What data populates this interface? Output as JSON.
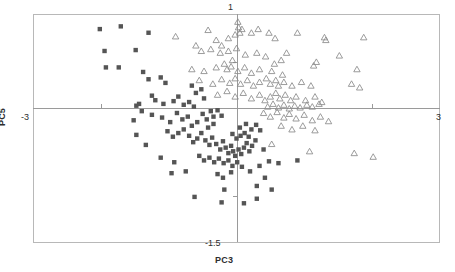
{
  "chart_data": {
    "type": "scatter",
    "title": "",
    "subtitle": "",
    "xlabel": "PC3",
    "ylabel": "PC5",
    "xlim": [
      -3,
      3
    ],
    "ylim": [
      -1.5,
      1
    ],
    "xticks": [
      -3,
      3
    ],
    "xtick_labels": [
      "-3",
      "3"
    ],
    "yticks": [
      -1.5,
      1
    ],
    "ytick_labels": [
      "-1.5",
      "1"
    ],
    "grid": false,
    "legend": "none",
    "axes_style": "crossed-at-origin-with-frame",
    "series": [
      {
        "name": "group-squares",
        "marker": "filled-square",
        "color": "#555555",
        "points": [
          [
            -2.02,
            0.84
          ],
          [
            -1.71,
            0.87
          ],
          [
            -1.3,
            0.8
          ],
          [
            -1.95,
            0.6
          ],
          [
            -1.49,
            0.61
          ],
          [
            -1.93,
            0.42
          ],
          [
            -1.74,
            0.42
          ],
          [
            -1.38,
            0.37
          ],
          [
            -1.3,
            0.29
          ],
          [
            -1.12,
            0.31
          ],
          [
            -1.05,
            0.25
          ],
          [
            -1.25,
            0.11
          ],
          [
            -1.2,
            0.06
          ],
          [
            -1.08,
            0.02
          ],
          [
            -0.93,
            0.05
          ],
          [
            -0.86,
            0.1
          ],
          [
            -0.78,
            0.01
          ],
          [
            -0.7,
            0.04
          ],
          [
            -0.63,
            -0.01
          ],
          [
            -1.44,
            0.02
          ],
          [
            -1.48,
            0.0
          ],
          [
            -1.4,
            -0.06
          ],
          [
            -1.52,
            -0.16
          ],
          [
            -1.25,
            -0.1
          ],
          [
            -1.1,
            -0.13
          ],
          [
            -0.98,
            -0.18
          ],
          [
            -0.88,
            -0.08
          ],
          [
            -0.8,
            -0.15
          ],
          [
            -0.72,
            -0.12
          ],
          [
            -0.66,
            -0.22
          ],
          [
            -0.58,
            -0.18
          ],
          [
            -0.5,
            -0.09
          ],
          [
            -0.44,
            -0.15
          ],
          [
            -0.38,
            -0.06
          ],
          [
            -0.34,
            -0.12
          ],
          [
            -0.28,
            -0.05
          ],
          [
            -0.22,
            -0.11
          ],
          [
            -1.02,
            -0.28
          ],
          [
            -0.94,
            -0.34
          ],
          [
            -0.86,
            -0.3
          ],
          [
            -0.78,
            -0.26
          ],
          [
            -0.7,
            -0.33
          ],
          [
            -0.64,
            -0.4
          ],
          [
            -0.58,
            -0.36
          ],
          [
            -0.52,
            -0.3
          ],
          [
            -0.46,
            -0.38
          ],
          [
            -0.4,
            -0.43
          ],
          [
            -0.36,
            -0.35
          ],
          [
            -0.3,
            -0.42
          ],
          [
            -0.24,
            -0.48
          ],
          [
            -0.2,
            -0.39
          ],
          [
            -0.16,
            -0.46
          ],
          [
            -0.12,
            -0.52
          ],
          [
            -0.08,
            -0.44
          ],
          [
            -0.05,
            -0.5
          ],
          [
            -0.02,
            -0.55
          ],
          [
            0.03,
            -0.48
          ],
          [
            0.07,
            -0.53
          ],
          [
            0.11,
            -0.46
          ],
          [
            0.15,
            -0.41
          ],
          [
            0.19,
            -0.5
          ],
          [
            0.23,
            -0.44
          ],
          [
            0.28,
            -0.38
          ],
          [
            0.18,
            -0.34
          ],
          [
            0.12,
            -0.3
          ],
          [
            0.06,
            -0.33
          ],
          [
            0.0,
            -0.36
          ],
          [
            -0.06,
            -0.31
          ],
          [
            -0.55,
            -0.55
          ],
          [
            -0.48,
            -0.6
          ],
          [
            -0.4,
            -0.57
          ],
          [
            -0.33,
            -0.62
          ],
          [
            -0.26,
            -0.58
          ],
          [
            -0.19,
            -0.63
          ],
          [
            -0.12,
            -0.6
          ],
          [
            -0.06,
            -0.66
          ],
          [
            0.01,
            -0.62
          ],
          [
            0.08,
            -0.67
          ],
          [
            -0.92,
            -0.62
          ],
          [
            -1.12,
            -0.57
          ],
          [
            -0.28,
            -0.75
          ],
          [
            -0.2,
            -0.79
          ],
          [
            -0.08,
            -0.73
          ],
          [
            0.2,
            -0.72
          ],
          [
            0.34,
            -0.66
          ],
          [
            0.48,
            -0.61
          ],
          [
            0.62,
            -0.63
          ],
          [
            0.9,
            -0.6
          ],
          [
            0.42,
            -0.79
          ],
          [
            0.3,
            -0.88
          ],
          [
            0.52,
            -0.92
          ],
          [
            -0.62,
            -1.0
          ],
          [
            -0.22,
            -1.06
          ],
          [
            0.11,
            -1.07
          ],
          [
            0.3,
            -1.02
          ],
          [
            -0.18,
            -0.92
          ],
          [
            -0.75,
            -0.72
          ],
          [
            -0.96,
            -0.74
          ],
          [
            -1.34,
            -0.43
          ],
          [
            -1.48,
            -0.32
          ],
          [
            -0.42,
            -0.24
          ],
          [
            -0.34,
            -0.2
          ],
          [
            0.22,
            -0.26
          ],
          [
            0.29,
            -0.21
          ],
          [
            0.35,
            -0.27
          ],
          [
            0.14,
            -0.2
          ],
          [
            0.05,
            -0.24
          ],
          [
            0.4,
            -0.48
          ],
          [
            -0.52,
            0.18
          ],
          [
            -0.66,
            0.22
          ],
          [
            -0.48,
            0.08
          ],
          [
            -0.6,
            0.14
          ]
        ]
      },
      {
        "name": "group-triangles",
        "marker": "open-triangle",
        "color": "#8a8a8a",
        "points": [
          [
            -0.9,
            0.76
          ],
          [
            -0.42,
            0.83
          ],
          [
            -0.3,
            0.72
          ],
          [
            -0.6,
            0.66
          ],
          [
            -0.22,
            0.66
          ],
          [
            -0.12,
            0.74
          ],
          [
            -0.02,
            0.78
          ],
          [
            0.02,
            0.92
          ],
          [
            0.03,
            0.86
          ],
          [
            0.05,
            0.8
          ],
          [
            0.08,
            0.84
          ],
          [
            0.22,
            0.8
          ],
          [
            0.32,
            0.84
          ],
          [
            0.48,
            0.8
          ],
          [
            0.57,
            0.74
          ],
          [
            0.9,
            0.8
          ],
          [
            1.3,
            0.75
          ],
          [
            1.32,
            0.72
          ],
          [
            1.88,
            0.75
          ],
          [
            -0.52,
            0.6
          ],
          [
            -0.38,
            0.62
          ],
          [
            -0.24,
            0.58
          ],
          [
            -0.12,
            0.6
          ],
          [
            0.0,
            0.63
          ],
          [
            0.13,
            0.56
          ],
          [
            0.3,
            0.58
          ],
          [
            0.43,
            0.54
          ],
          [
            0.74,
            0.58
          ],
          [
            1.52,
            0.55
          ],
          [
            -0.66,
            0.4
          ],
          [
            -0.48,
            0.38
          ],
          [
            -0.3,
            0.42
          ],
          [
            -0.14,
            0.4
          ],
          [
            -0.08,
            0.43
          ],
          [
            0.02,
            0.38
          ],
          [
            0.12,
            0.42
          ],
          [
            0.22,
            0.36
          ],
          [
            0.34,
            0.4
          ],
          [
            0.52,
            0.38
          ],
          [
            0.68,
            0.34
          ],
          [
            1.78,
            0.4
          ],
          [
            -0.55,
            0.28
          ],
          [
            -0.35,
            0.24
          ],
          [
            -0.22,
            0.29
          ],
          [
            -0.1,
            0.25
          ],
          [
            -0.02,
            0.3
          ],
          [
            0.06,
            0.24
          ],
          [
            0.16,
            0.28
          ],
          [
            0.25,
            0.22
          ],
          [
            0.34,
            0.26
          ],
          [
            0.44,
            0.3
          ],
          [
            0.5,
            0.24
          ],
          [
            0.58,
            0.28
          ],
          [
            0.62,
            0.22
          ],
          [
            0.7,
            0.26
          ],
          [
            0.82,
            0.22
          ],
          [
            0.96,
            0.26
          ],
          [
            1.1,
            0.22
          ],
          [
            1.7,
            0.24
          ],
          [
            1.82,
            0.2
          ],
          [
            -0.28,
            0.12
          ],
          [
            -0.14,
            0.16
          ],
          [
            -0.02,
            0.1
          ],
          [
            0.1,
            0.14
          ],
          [
            0.22,
            0.08
          ],
          [
            0.34,
            0.12
          ],
          [
            0.42,
            0.06
          ],
          [
            0.5,
            0.1
          ],
          [
            0.58,
            0.14
          ],
          [
            0.64,
            0.08
          ],
          [
            0.72,
            0.12
          ],
          [
            0.8,
            0.06
          ],
          [
            0.88,
            0.1
          ],
          [
            1.02,
            0.06
          ],
          [
            1.16,
            0.1
          ],
          [
            1.26,
            0.04
          ],
          [
            0.46,
            -0.01
          ],
          [
            0.54,
            0.02
          ],
          [
            0.62,
            -0.02
          ],
          [
            0.7,
            0.01
          ],
          [
            0.78,
            -0.03
          ],
          [
            0.86,
            0.0
          ],
          [
            0.94,
            -0.02
          ],
          [
            1.04,
            0.01
          ],
          [
            1.12,
            -0.01
          ],
          [
            1.22,
            0.02
          ],
          [
            0.4,
            -0.08
          ],
          [
            0.5,
            -0.12
          ],
          [
            0.6,
            -0.07
          ],
          [
            0.7,
            -0.13
          ],
          [
            0.78,
            -0.09
          ],
          [
            0.88,
            -0.14
          ],
          [
            1.0,
            -0.1
          ],
          [
            1.12,
            -0.16
          ],
          [
            1.24,
            -0.12
          ],
          [
            1.36,
            -0.17
          ],
          [
            0.66,
            -0.22
          ],
          [
            0.82,
            -0.26
          ],
          [
            0.98,
            -0.22
          ],
          [
            1.16,
            -0.27
          ],
          [
            0.52,
            -0.42
          ],
          [
            1.08,
            -0.5
          ],
          [
            1.74,
            -0.52
          ],
          [
            2.02,
            -0.56
          ],
          [
            -0.18,
            0.46
          ],
          [
            -0.06,
            0.5
          ],
          [
            0.56,
            0.46
          ],
          [
            0.66,
            0.5
          ],
          [
            1.14,
            0.44
          ],
          [
            1.18,
            0.48
          ]
        ]
      }
    ]
  }
}
